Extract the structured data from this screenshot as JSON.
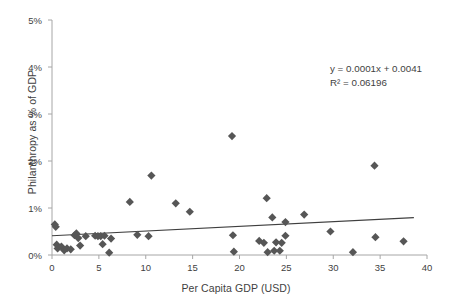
{
  "chart_data": {
    "type": "scatter",
    "title": "",
    "xlabel": "Per Capita GDP (USD)",
    "ylabel": "Philanthropy as % of GDP",
    "xlim": [
      0,
      40
    ],
    "ylim": [
      0,
      0.05
    ],
    "xticks": [
      0,
      5,
      10,
      15,
      20,
      25,
      30,
      35,
      40
    ],
    "xtick_labels": [
      "0",
      "5",
      "10",
      "15",
      "20",
      "25",
      "30",
      "35",
      "40"
    ],
    "yticks": [
      0,
      0.01,
      0.02,
      0.03,
      0.04,
      0.05
    ],
    "ytick_labels": [
      "0%",
      "1%",
      "2%",
      "3%",
      "4%",
      "5%"
    ],
    "grid": false,
    "legend": false,
    "marker": "diamond",
    "marker_color": "#565656",
    "marker_size": 7,
    "axis_color": "#a6a6a6",
    "trendline": {
      "type": "linear",
      "color": "#3f3f3f",
      "equation": "y = 0.0001x + 0.0041",
      "r_squared_label": "R² = 0.06196",
      "slope": 0.0001,
      "intercept": 0.0041,
      "x_start": 0.0,
      "x_end": 38.6
    },
    "points": [
      {
        "x": 0.3,
        "y": 0.0065
      },
      {
        "x": 0.4,
        "y": 0.006
      },
      {
        "x": 0.5,
        "y": 0.0022
      },
      {
        "x": 0.6,
        "y": 0.0014
      },
      {
        "x": 1.0,
        "y": 0.0018
      },
      {
        "x": 1.3,
        "y": 0.001
      },
      {
        "x": 1.6,
        "y": 0.0014
      },
      {
        "x": 2.0,
        "y": 0.0012
      },
      {
        "x": 2.4,
        "y": 0.0042
      },
      {
        "x": 2.6,
        "y": 0.0046
      },
      {
        "x": 2.8,
        "y": 0.0036
      },
      {
        "x": 3.0,
        "y": 0.002
      },
      {
        "x": 3.6,
        "y": 0.004
      },
      {
        "x": 4.6,
        "y": 0.0041
      },
      {
        "x": 4.9,
        "y": 0.004
      },
      {
        "x": 5.2,
        "y": 0.004
      },
      {
        "x": 5.4,
        "y": 0.0023
      },
      {
        "x": 5.6,
        "y": 0.0041
      },
      {
        "x": 6.1,
        "y": 0.0005
      },
      {
        "x": 6.3,
        "y": 0.0035
      },
      {
        "x": 8.3,
        "y": 0.0113
      },
      {
        "x": 9.1,
        "y": 0.0043
      },
      {
        "x": 10.3,
        "y": 0.004
      },
      {
        "x": 10.6,
        "y": 0.0169
      },
      {
        "x": 13.2,
        "y": 0.011
      },
      {
        "x": 14.7,
        "y": 0.0092
      },
      {
        "x": 19.2,
        "y": 0.0253
      },
      {
        "x": 19.3,
        "y": 0.0042
      },
      {
        "x": 19.4,
        "y": 0.0007
      },
      {
        "x": 22.1,
        "y": 0.003
      },
      {
        "x": 22.6,
        "y": 0.0026
      },
      {
        "x": 22.9,
        "y": 0.0121
      },
      {
        "x": 23.0,
        "y": 0.0006
      },
      {
        "x": 23.5,
        "y": 0.008
      },
      {
        "x": 23.7,
        "y": 0.0009
      },
      {
        "x": 23.9,
        "y": 0.0027
      },
      {
        "x": 24.3,
        "y": 0.0009
      },
      {
        "x": 24.5,
        "y": 0.0026
      },
      {
        "x": 24.9,
        "y": 0.007
      },
      {
        "x": 24.9,
        "y": 0.0041
      },
      {
        "x": 26.9,
        "y": 0.0086
      },
      {
        "x": 29.7,
        "y": 0.005
      },
      {
        "x": 32.1,
        "y": 0.0006
      },
      {
        "x": 34.4,
        "y": 0.019
      },
      {
        "x": 34.5,
        "y": 0.0038
      },
      {
        "x": 37.5,
        "y": 0.0029
      }
    ]
  },
  "annotations": {
    "equation_line1": "y = 0.0001x + 0.0041",
    "equation_line2": "R² = 0.06196"
  }
}
